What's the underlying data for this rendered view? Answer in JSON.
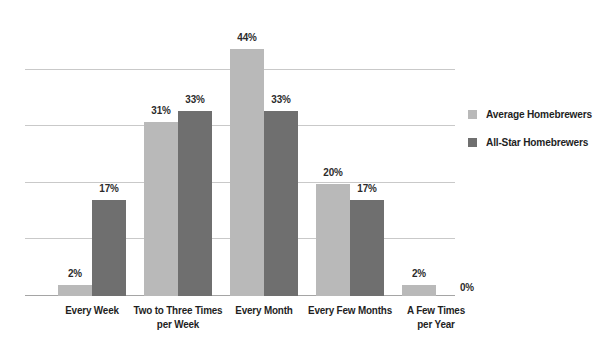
{
  "chart_data": {
    "type": "bar",
    "title": "",
    "subtitle": "",
    "xlabel": "",
    "ylabel": "",
    "ylim": [
      0,
      50
    ],
    "grid": true,
    "gridlines": [
      10,
      20,
      30,
      40
    ],
    "legend_position": "right",
    "value_suffix": "%",
    "categories": [
      "Every Week",
      "Two to Three Times per Week",
      "Every Month",
      "Every Few Months",
      "A Few Times per Year"
    ],
    "category_lines": [
      [
        "Every Week"
      ],
      [
        "Two to Three Times",
        "per Week"
      ],
      [
        "Every Month"
      ],
      [
        "Every Few Months"
      ],
      [
        "A Few Times",
        "per Year"
      ]
    ],
    "series": [
      {
        "name": "Average Homebrewers",
        "color": "#b9b9b9",
        "values": [
          2,
          31,
          44,
          20,
          2
        ],
        "labels": [
          "2%",
          "31%",
          "44%",
          "20%",
          "2%"
        ]
      },
      {
        "name": "All-Star Homebrewers",
        "color": "#6f6f6f",
        "values": [
          17,
          33,
          33,
          17,
          0
        ],
        "labels": [
          "17%",
          "33%",
          "33%",
          "17%",
          "0%"
        ]
      }
    ]
  },
  "legend": {
    "items": [
      {
        "label": "Average Homebrewers",
        "color": "#b9b9b9"
      },
      {
        "label": "All-Star Homebrewers",
        "color": "#6f6f6f"
      }
    ]
  },
  "axis": {
    "gridline_color": "#c9c9c9",
    "baseline_color": "#a5a5a5"
  },
  "bars": {
    "groups": [
      {
        "category_lines": [
          "Every Week"
        ],
        "a": {
          "value": 2,
          "label": "2%"
        },
        "b": {
          "value": 17,
          "label": "17%"
        }
      },
      {
        "category_lines": [
          "Two to Three Times",
          "per Week"
        ],
        "a": {
          "value": 31,
          "label": "31%"
        },
        "b": {
          "value": 33,
          "label": "33%"
        }
      },
      {
        "category_lines": [
          "Every Month"
        ],
        "a": {
          "value": 44,
          "label": "44%"
        },
        "b": {
          "value": 33,
          "label": "33%"
        }
      },
      {
        "category_lines": [
          "Every Few Months"
        ],
        "a": {
          "value": 20,
          "label": "20%"
        },
        "b": {
          "value": 17,
          "label": "17%"
        }
      },
      {
        "category_lines": [
          "A Few Times",
          "per Year"
        ],
        "a": {
          "value": 2,
          "label": "2%"
        },
        "b": {
          "value": 0,
          "label": "0%"
        }
      }
    ]
  }
}
